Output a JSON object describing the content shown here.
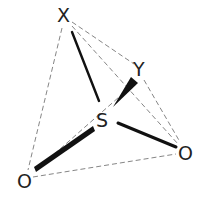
{
  "diagram": {
    "title": "",
    "type": "tetrahedral molecular geometry",
    "central_atom": {
      "label": "S",
      "x": 104,
      "y": 121
    },
    "atoms": [
      {
        "id": "X",
        "label": "X",
        "x": 65,
        "y": 21
      },
      {
        "id": "Y",
        "label": "Y",
        "x": 141,
        "y": 73
      },
      {
        "id": "O1",
        "label": "O",
        "x": 23,
        "y": 186
      },
      {
        "id": "O2",
        "label": "O",
        "x": 186,
        "y": 158
      }
    ],
    "bonds": [
      {
        "from": "S",
        "to": "X",
        "style": "solid"
      },
      {
        "from": "S",
        "to": "Y",
        "style": "wedge"
      },
      {
        "from": "S",
        "to": "O1",
        "style": "wedge"
      },
      {
        "from": "S",
        "to": "O2",
        "style": "solid"
      }
    ],
    "edges_dashed": [
      [
        "X",
        "Y"
      ],
      [
        "X",
        "O1"
      ],
      [
        "X",
        "O2"
      ],
      [
        "Y",
        "O1"
      ],
      [
        "Y",
        "O2"
      ],
      [
        "O1",
        "O2"
      ]
    ],
    "colors": {
      "bond": "#111111",
      "dash": "#777777",
      "label": "#222222"
    }
  }
}
